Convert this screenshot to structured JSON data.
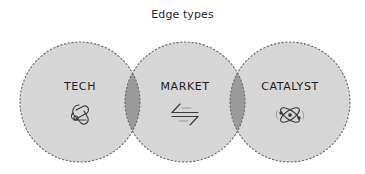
{
  "title": "Edge types",
  "colors": {
    "circle_fill": "#d6d6d6",
    "overlap_fill": "#9a9a9a",
    "dashed_stroke": "#6a6a6a",
    "icon_stroke": "#3a3a3a",
    "text": "#1e1e1e"
  },
  "nodes": [
    {
      "label": "TECH",
      "icon": "knot-icon"
    },
    {
      "label": "MARKET",
      "icon": "exchange-arrows-icon"
    },
    {
      "label": "CATALYST",
      "icon": "atom-icon"
    }
  ]
}
